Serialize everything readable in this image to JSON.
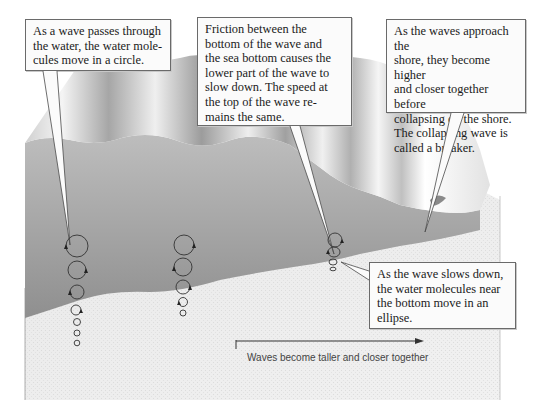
{
  "diagram": {
    "callouts": [
      {
        "id": "circular-motion",
        "lines": [
          "As a wave passes through",
          "the water, the water mole-",
          "cules move in a circle."
        ]
      },
      {
        "id": "friction",
        "lines": [
          "Friction between the",
          "bottom of the wave and",
          "the sea bottom causes the",
          "lower part of the wave to",
          "slow down. The speed at",
          "the top of the wave re-",
          "mains the same."
        ]
      },
      {
        "id": "breaker",
        "lines": [
          "As the waves approach the",
          "shore, they become higher",
          "and closer together before",
          "collapsing on the shore.",
          "The collapsing wave is",
          "called a breaker."
        ]
      },
      {
        "id": "ellipse-motion",
        "lines": [
          "As the wave slows down,",
          "the water molecules near",
          "the bottom move in an",
          "ellipse."
        ]
      }
    ],
    "arrow_caption": "Waves become taller and closer together",
    "orbit_columns": [
      {
        "label": "deep-water-column-1",
        "shape": "circle",
        "count": 7
      },
      {
        "label": "deep-water-column-2",
        "shape": "circle",
        "count": 5
      },
      {
        "label": "shallow-water-column",
        "shape": "ellipse",
        "count": 4
      }
    ],
    "colors": {
      "water_surface_light": "#f2f2f2",
      "water_surface_dark": "#9a9a9a",
      "water_side": "#a8a8a8",
      "sea_floor": "#e6e6e6",
      "callout_border": "#6a6a6a",
      "callout_fill": "#fbfbfb",
      "leader_line": "#4a4a4a"
    }
  }
}
